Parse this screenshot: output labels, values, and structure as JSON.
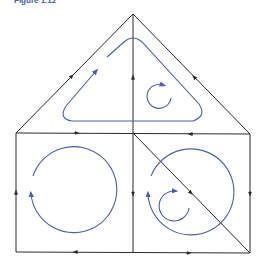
{
  "caption": "Figure 1.12",
  "colors": {
    "edge": "#2a2a2a",
    "circulation": "#4a5fb0",
    "background": "#ffffff"
  },
  "diagram": {
    "type": "circulation-network",
    "nodes": {
      "apex": [
        133,
        14
      ],
      "left_corner": [
        16,
        133
      ],
      "mid_top": [
        133,
        133
      ],
      "right_corner": [
        250,
        134
      ],
      "bottom_left": [
        16,
        252
      ],
      "bottom_mid": [
        133,
        252
      ],
      "bottom_right": [
        250,
        253
      ]
    },
    "edges": [
      {
        "from": "left_corner",
        "to": "apex",
        "arrow": "toward-apex"
      },
      {
        "from": "right_corner",
        "to": "apex",
        "arrow": "toward-apex"
      },
      {
        "from": "mid_top",
        "to": "apex",
        "arrow": "up"
      },
      {
        "from": "left_corner",
        "to": "mid_top",
        "arrow": "right"
      },
      {
        "from": "right_corner",
        "to": "mid_top",
        "arrow": "left"
      },
      {
        "from": "bottom_left",
        "to": "left_corner",
        "arrow": "up"
      },
      {
        "from": "mid_top",
        "to": "bottom_mid",
        "arrow": "down"
      },
      {
        "from": "right_corner",
        "to": "bottom_right",
        "arrow": "down"
      },
      {
        "from": "bottom_mid",
        "to": "bottom_left",
        "arrow": "left"
      },
      {
        "from": "bottom_mid",
        "to": "bottom_right",
        "arrow": "right"
      },
      {
        "from": "mid_top",
        "to": "bottom_right",
        "arrow": "down-right"
      }
    ],
    "circulations": [
      {
        "region": "triangle",
        "shape": "rounded-triangle",
        "direction": "clockwise"
      },
      {
        "region": "triangle-inner",
        "shape": "circle",
        "center": [
          159,
          96
        ],
        "radius": 12,
        "direction": "clockwise"
      },
      {
        "region": "left-square",
        "shape": "circle",
        "center": [
          75,
          194
        ],
        "radius": 43,
        "direction": "clockwise"
      },
      {
        "region": "right-square",
        "shape": "circle",
        "center": [
          192,
          195
        ],
        "radius": 43,
        "direction": "clockwise"
      },
      {
        "region": "right-square-inner",
        "shape": "circle",
        "center": [
          174,
          206
        ],
        "radius": 15,
        "direction": "clockwise"
      }
    ]
  }
}
